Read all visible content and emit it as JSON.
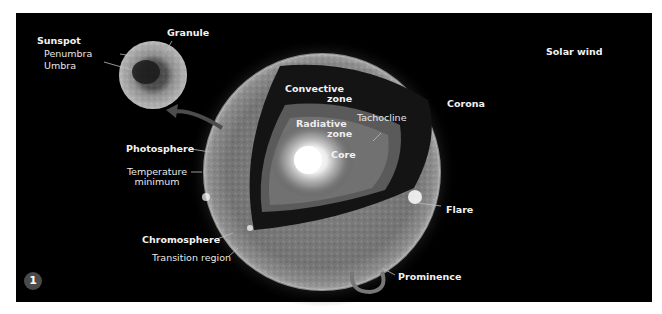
{
  "figure": {
    "number": "1",
    "background": "#000000",
    "labels": {
      "sunspot": "Sunspot",
      "penumbra": "Penumbra",
      "umbra": "Umbra",
      "granule": "Granule",
      "solar_wind": "Solar wind",
      "convective_zone_line1": "Convective",
      "convective_zone_line2": "zone",
      "radiative_zone_line1": "Radiative",
      "radiative_zone_line2": "zone",
      "tachocline": "Tachocline",
      "core": "Core",
      "corona": "Corona",
      "photosphere": "Photosphere",
      "temperature_minimum_line1": "Temperature",
      "temperature_minimum_line2": "minimum",
      "flare": "Flare",
      "chromosphere": "Chromosphere",
      "transition_region": "Transition region",
      "prominence": "Prominence"
    }
  }
}
